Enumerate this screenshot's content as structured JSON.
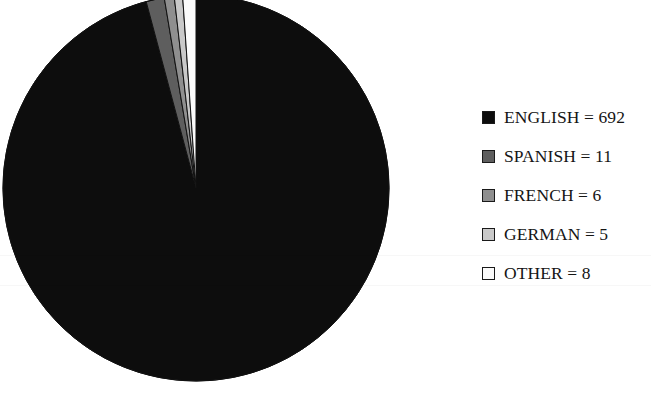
{
  "chart_data": {
    "type": "pie",
    "title": "",
    "subtitle": "",
    "xlabel": "",
    "ylabel": "",
    "grid": false,
    "legend_position": "right",
    "total": 722,
    "start_angle_deg": 0,
    "direction": "clockwise",
    "categories": [
      "ENGLISH",
      "SPANISH",
      "FRENCH",
      "GERMAN",
      "OTHER"
    ],
    "values": [
      692,
      11,
      6,
      5,
      8
    ],
    "percentages": [
      95.8,
      1.5,
      0.8,
      0.7,
      1.1
    ],
    "colors": [
      "#0d0d0d",
      "#5e5e5e",
      "#8f8f8f",
      "#c9c9c9",
      "#fbfbfb"
    ],
    "slice_labels": [
      "ENGLISH = 692",
      "SPANISH = 11",
      "FRENCH = 6",
      "GERMAN = 5",
      "OTHER = 8"
    ],
    "legend_entries": [
      {
        "label": "ENGLISH = 692",
        "name": "ENGLISH",
        "value": 692,
        "color": "#0d0d0d"
      },
      {
        "label": "SPANISH = 11",
        "name": "SPANISH",
        "value": 11,
        "color": "#5e5e5e"
      },
      {
        "label": "FRENCH = 6",
        "name": "FRENCH",
        "value": 6,
        "color": "#8f8f8f"
      },
      {
        "label": "GERMAN = 5",
        "name": "GERMAN",
        "value": 5,
        "color": "#c9c9c9"
      },
      {
        "label": "OTHER = 8",
        "name": "OTHER",
        "value": 8,
        "color": "#fbfbfb"
      }
    ]
  },
  "figure": {
    "background": "#ffffff",
    "outline_color": "#111111",
    "pie": {
      "center_x": 196,
      "center_y": 188,
      "radius": 193
    }
  },
  "legend": {
    "items": [
      {
        "label": "ENGLISH = 692"
      },
      {
        "label": "SPANISH = 11"
      },
      {
        "label": "FRENCH = 6"
      },
      {
        "label": "GERMAN = 5"
      },
      {
        "label": "OTHER = 8"
      }
    ]
  }
}
